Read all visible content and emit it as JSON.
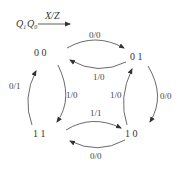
{
  "legend": {
    "state_vars": "Q1Q0",
    "q1": "Q",
    "q1_sub": "1",
    "q0": "Q",
    "q0_sub": "0",
    "io_label": "X/Z"
  },
  "states": [
    {
      "id": "s00",
      "label": "0 0"
    },
    {
      "id": "s01",
      "label": "0 1"
    },
    {
      "id": "s11",
      "label": "1 1"
    },
    {
      "id": "s10",
      "label": "1 0"
    }
  ],
  "transitions": [
    {
      "from": "00",
      "to": "01",
      "label": "0/0"
    },
    {
      "from": "01",
      "to": "00",
      "label": "1/0"
    },
    {
      "from": "00",
      "to": "11",
      "label": "1/0"
    },
    {
      "from": "11",
      "to": "00",
      "label": "0/1"
    },
    {
      "from": "01",
      "to": "10",
      "label": "0/0"
    },
    {
      "from": "10",
      "to": "01",
      "label": "1/0"
    },
    {
      "from": "11",
      "to": "10",
      "label": "1/1"
    },
    {
      "from": "10",
      "to": "11",
      "label": "0/0"
    }
  ]
}
